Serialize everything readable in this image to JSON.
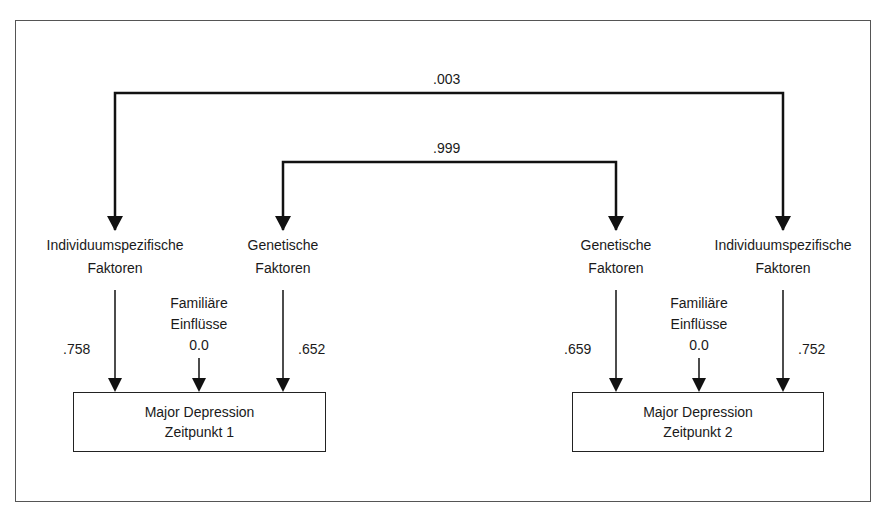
{
  "diagram": {
    "type": "path-diagram",
    "correlations": {
      "individual_factors": ".003",
      "genetic_factors": ".999"
    },
    "timepoint1": {
      "individual": {
        "line1": "Individuumspezifische",
        "line2": "Faktoren",
        "path": ".758"
      },
      "genetic": {
        "line1": "Genetische",
        "line2": "Faktoren",
        "path": ".652"
      },
      "familial": {
        "line1": "Familiäre",
        "line2": "Einflüsse",
        "path": "0.0"
      },
      "outcome": {
        "line1": "Major Depression",
        "line2": "Zeitpunkt 1"
      }
    },
    "timepoint2": {
      "genetic": {
        "line1": "Genetische",
        "line2": "Faktoren",
        "path": ".659"
      },
      "individual": {
        "line1": "Individuumspezifische",
        "line2": "Faktoren",
        "path": ".752"
      },
      "familial": {
        "line1": "Familiäre",
        "line2": "Einflüsse",
        "path": "0.0"
      },
      "outcome": {
        "line1": "Major Depression",
        "line2": "Zeitpunkt 2"
      }
    },
    "colors": {
      "line": "#111111",
      "text": "#1a1a1a",
      "frame": "#555555"
    }
  }
}
